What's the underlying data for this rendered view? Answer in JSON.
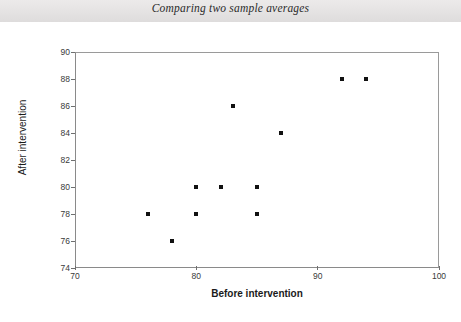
{
  "header": {
    "title": "Comparing two sample averages"
  },
  "chart_data": {
    "type": "scatter",
    "title": "",
    "xlabel": "Before intervention",
    "ylabel": "After intervention",
    "xlim": [
      70,
      100
    ],
    "ylim": [
      74,
      90
    ],
    "xticks": [
      70,
      80,
      90,
      100
    ],
    "yticks": [
      74,
      76,
      78,
      80,
      82,
      84,
      86,
      88,
      90
    ],
    "grid": false,
    "legend": null,
    "marker": "square",
    "marker_color": "#111111",
    "points": [
      {
        "x": 76,
        "y": 78
      },
      {
        "x": 78,
        "y": 76
      },
      {
        "x": 80,
        "y": 80
      },
      {
        "x": 80,
        "y": 78
      },
      {
        "x": 82,
        "y": 80
      },
      {
        "x": 83,
        "y": 86
      },
      {
        "x": 85,
        "y": 80
      },
      {
        "x": 85,
        "y": 78
      },
      {
        "x": 87,
        "y": 84
      },
      {
        "x": 92,
        "y": 88
      },
      {
        "x": 94,
        "y": 88
      }
    ]
  }
}
